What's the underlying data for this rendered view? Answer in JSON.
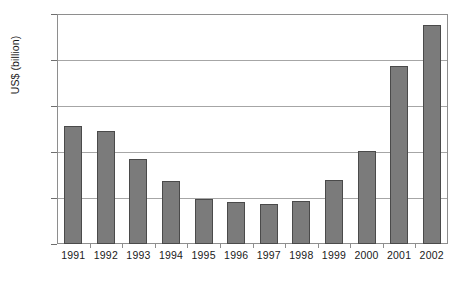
{
  "chart_data": {
    "type": "bar",
    "title": "",
    "subtitle": "",
    "xlabel": "",
    "ylabel": "US$ (billion)",
    "categories": [
      "1991",
      "1992",
      "1993",
      "1994",
      "1995",
      "1996",
      "1997",
      "1998",
      "1999",
      "2000",
      "2001",
      "2002"
    ],
    "values": [
      128,
      123,
      92,
      68,
      49,
      46,
      44,
      47,
      70,
      101,
      194,
      238
    ],
    "ylim": [
      0,
      250
    ],
    "y_ticks": [
      0,
      50,
      100,
      150,
      200,
      250
    ],
    "y_tick_labels": [
      "0",
      "50",
      "100",
      "150",
      "200",
      "250"
    ],
    "grid": "horizontal",
    "legend": "none",
    "series": [
      {
        "name": "US$ (billion)",
        "values": [
          128,
          123,
          92,
          68,
          49,
          46,
          44,
          47,
          70,
          101,
          194,
          238
        ]
      }
    ],
    "colors": {
      "bar_fill": "#7b7b7b",
      "bar_border": "#4a4a4a",
      "gridline": "#a6a6a6",
      "frame": "#8e8e8e",
      "text": "#1a1a1a",
      "background": "#ffffff"
    }
  }
}
